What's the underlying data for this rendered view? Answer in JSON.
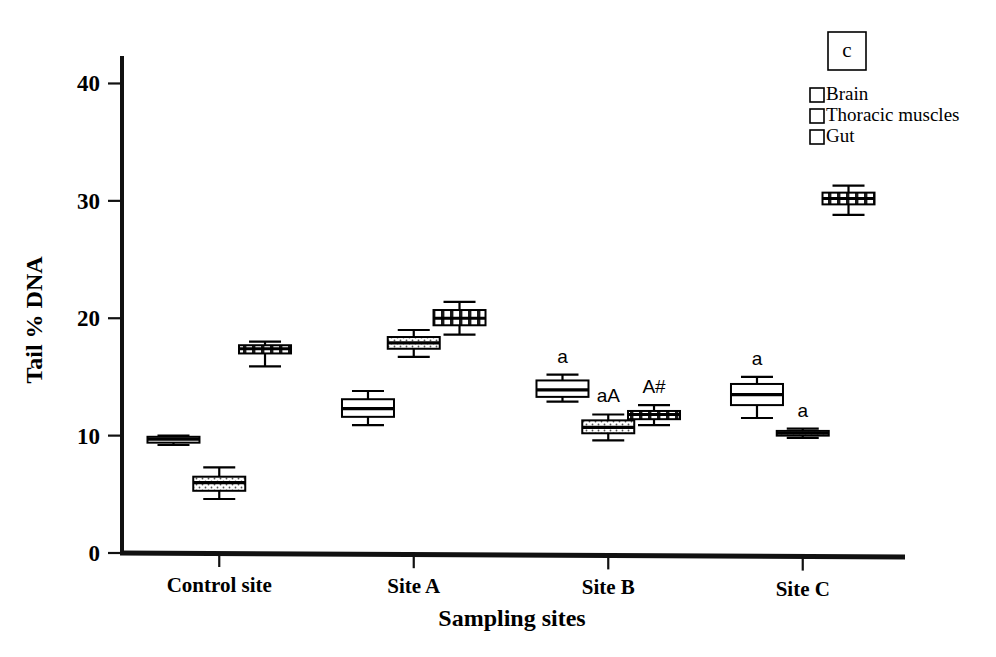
{
  "chart_data": {
    "type": "box",
    "title": "",
    "panel_label": "c",
    "xlabel": "Sampling sites",
    "ylabel": "Tail % DNA",
    "categories": [
      "Control site",
      "Site A",
      "Site B",
      "Site C"
    ],
    "yticks": [
      0,
      10,
      20,
      30,
      40
    ],
    "ylim": [
      0,
      42
    ],
    "grid": false,
    "legend_position": "top-right",
    "legend": [
      {
        "name": "Brain",
        "pattern": "empty"
      },
      {
        "name": "Thoracic muscles",
        "pattern": "dotted"
      },
      {
        "name": "Gut",
        "pattern": "vertical-stripes"
      }
    ],
    "series": [
      {
        "name": "Brain",
        "pattern": "empty",
        "boxes": [
          {
            "category": "Control site",
            "whisker_low": 9.2,
            "q1": 9.4,
            "median": 9.7,
            "q3": 9.9,
            "whisker_high": 10.0,
            "annotation": ""
          },
          {
            "category": "Site A",
            "whisker_low": 10.9,
            "q1": 11.6,
            "median": 12.3,
            "q3": 13.1,
            "whisker_high": 13.8,
            "annotation": ""
          },
          {
            "category": "Site B",
            "whisker_low": 12.9,
            "q1": 13.3,
            "median": 13.9,
            "q3": 14.7,
            "whisker_high": 15.2,
            "annotation": "a"
          },
          {
            "category": "Site C",
            "whisker_low": 11.5,
            "q1": 12.6,
            "median": 13.5,
            "q3": 14.4,
            "whisker_high": 15.0,
            "annotation": "a"
          }
        ]
      },
      {
        "name": "Thoracic muscles",
        "pattern": "dotted",
        "boxes": [
          {
            "category": "Control site",
            "whisker_low": 4.6,
            "q1": 5.3,
            "median": 6.0,
            "q3": 6.5,
            "whisker_high": 7.3,
            "annotation": ""
          },
          {
            "category": "Site A",
            "whisker_low": 16.7,
            "q1": 17.4,
            "median": 17.9,
            "q3": 18.4,
            "whisker_high": 19.0,
            "annotation": ""
          },
          {
            "category": "Site B",
            "whisker_low": 9.6,
            "q1": 10.2,
            "median": 10.7,
            "q3": 11.3,
            "whisker_high": 11.8,
            "annotation": "aA"
          },
          {
            "category": "Site C",
            "whisker_low": 9.8,
            "q1": 10.0,
            "median": 10.2,
            "q3": 10.4,
            "whisker_high": 10.6,
            "annotation": "a"
          }
        ]
      },
      {
        "name": "Gut",
        "pattern": "vertical-stripes",
        "boxes": [
          {
            "category": "Control site",
            "whisker_low": 15.9,
            "q1": 17.0,
            "median": 17.4,
            "q3": 17.7,
            "whisker_high": 18.0,
            "annotation": ""
          },
          {
            "category": "Site A",
            "whisker_low": 18.6,
            "q1": 19.4,
            "median": 20.0,
            "q3": 20.7,
            "whisker_high": 21.4,
            "annotation": ""
          },
          {
            "category": "Site B",
            "whisker_low": 10.9,
            "q1": 11.4,
            "median": 11.8,
            "q3": 12.1,
            "whisker_high": 12.6,
            "annotation": "A#"
          },
          {
            "category": "Site C",
            "whisker_low": 28.8,
            "q1": 29.7,
            "median": 30.2,
            "q3": 30.7,
            "whisker_high": 31.3,
            "annotation": ""
          }
        ]
      }
    ]
  }
}
